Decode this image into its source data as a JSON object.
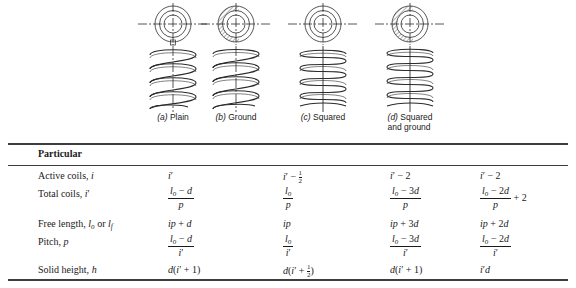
{
  "figure": {
    "springs": [
      {
        "id": "plain",
        "label": "(a)",
        "name": "Plain",
        "ground": false,
        "caption_line2": ""
      },
      {
        "id": "ground",
        "label": "(b)",
        "name": "Ground",
        "ground": true,
        "caption_line2": ""
      },
      {
        "id": "squared",
        "label": "(c)",
        "name": "Squared",
        "ground": false,
        "caption_line2": ""
      },
      {
        "id": "squared-and-ground",
        "label": "(d)",
        "name": "Squared",
        "ground": true,
        "caption_line2": "and ground"
      }
    ]
  },
  "table": {
    "header": "Particular",
    "rows": [
      {
        "name": "active-coils",
        "label_text": "Active coils, ",
        "label_sym": "i",
        "label_prime": "",
        "plain": "i′",
        "ground": "i′ − 1/2",
        "squared": "i′ − 2",
        "squared_ground": "i′ − 2"
      },
      {
        "name": "total-coils",
        "label_text": "Total coils, ",
        "label_sym": "i",
        "label_prime": "′",
        "plain": "(lₒ − d)/p",
        "ground": "lₒ/p",
        "squared": "(lₒ − 3d)/p",
        "squared_ground": "(lₒ − 2d)/p + 2"
      },
      {
        "name": "free-length",
        "label_text": "Free length, lₒ or lƒ",
        "label_sym": "",
        "label_prime": "",
        "plain": "ip + d",
        "ground": "ip",
        "squared": "ip + 3d",
        "squared_ground": "ip + 2d"
      },
      {
        "name": "pitch",
        "label_text": "Pitch, ",
        "label_sym": "p",
        "label_prime": "",
        "plain": "(lₒ − d)/i′",
        "ground": "lₒ/i′",
        "squared": "(lₒ − 3d)/i′",
        "squared_ground": "(lₒ − 2d)/i′"
      },
      {
        "name": "solid-height",
        "label_text": "Solid height, ",
        "label_sym": "h",
        "label_prime": "",
        "plain": "d(i′ + 1)",
        "ground": "d(i′ + 1/2)",
        "squared": "d(i′ + 1)",
        "squared_ground": "i′d"
      }
    ]
  },
  "labels": {
    "particular": "Particular",
    "active_coils": "Active coils,",
    "total_coils": "Total coils,",
    "free_length": "Free length,",
    "pitch": "Pitch,",
    "solid_height": "Solid height,",
    "free_length_syms": "lₒ or lƒ"
  },
  "colors": {
    "ink": "#1a1a1a",
    "rule": "#3d3d3d",
    "background": "#ffffff",
    "drawing": "#2b2b2b"
  }
}
